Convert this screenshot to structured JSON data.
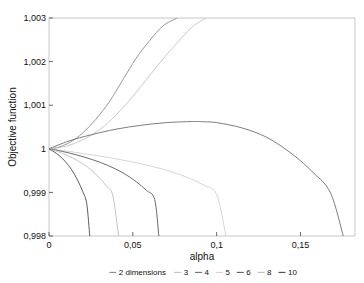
{
  "chart_data": {
    "type": "line",
    "title": "",
    "xlabel": "alpha",
    "ylabel": "Objective function",
    "xlim": [
      0,
      0.1825
    ],
    "ylim": [
      0.998,
      1.003
    ],
    "grid": false,
    "legend_position": "bottom",
    "x_tick_labels": [
      "0",
      "0,05",
      "0,1",
      "0,15"
    ],
    "x_tick_values": [
      0,
      0.05,
      0.1,
      0.15
    ],
    "y_tick_labels": [
      "1,003",
      "1,002",
      "1,001",
      "1",
      "0,999",
      "0,998"
    ],
    "y_tick_values": [
      1.003,
      1.002,
      1.001,
      1.0,
      0.999,
      0.998
    ],
    "legend_title": "dimensions",
    "series": [
      {
        "name": "2",
        "legend_label": "2 dimensions",
        "color": "#8c8c8c",
        "x": [
          0,
          0.006,
          0.013,
          0.02,
          0.028,
          0.036,
          0.044,
          0.052,
          0.06,
          0.068,
          0.0765
        ],
        "values": [
          1.0,
          1.00004,
          1.00016,
          1.00036,
          1.00068,
          1.00108,
          1.00158,
          1.00208,
          1.00248,
          1.00282,
          1.003
        ]
      },
      {
        "name": "3",
        "legend_label": "3",
        "color": "#c2c2c2",
        "x": [
          0,
          0.008,
          0.017,
          0.026,
          0.035,
          0.045,
          0.055,
          0.065,
          0.075,
          0.085,
          0.0935
        ],
        "values": [
          1.0,
          1.00004,
          1.00015,
          1.00033,
          1.00059,
          1.00098,
          1.00144,
          1.00192,
          1.00237,
          1.00278,
          1.003
        ]
      },
      {
        "name": "4",
        "legend_label": "4",
        "color": "#6e6e6e",
        "x": [
          0,
          0.012,
          0.025,
          0.04,
          0.055,
          0.07,
          0.085,
          0.092,
          0.1,
          0.115,
          0.13,
          0.145,
          0.158,
          0.168,
          0.1755
        ],
        "values": [
          1.0,
          1.00018,
          1.00032,
          1.00045,
          1.00054,
          1.0006,
          1.000625,
          1.00062,
          1.0006,
          1.00048,
          1.00026,
          0.99988,
          0.99944,
          0.99898,
          0.998
        ]
      },
      {
        "name": "5",
        "legend_label": "5",
        "color": "#d0d0d0",
        "x": [
          0,
          0.012,
          0.025,
          0.04,
          0.055,
          0.07,
          0.082,
          0.092,
          0.1,
          0.1055
        ],
        "values": [
          1.0,
          0.99994,
          0.999865,
          0.99977,
          0.999655,
          0.99951,
          0.99935,
          0.99917,
          0.99895,
          0.998
        ]
      },
      {
        "name": "6",
        "legend_label": "6",
        "color": "#5a5a5a",
        "x": [
          0,
          0.008,
          0.017,
          0.026,
          0.035,
          0.044,
          0.052,
          0.058,
          0.063,
          0.0655
        ],
        "values": [
          1.0,
          0.99994,
          0.999855,
          0.99975,
          0.99962,
          0.99945,
          0.999245,
          0.99905,
          0.99884,
          0.998
        ]
      },
      {
        "name": "8",
        "legend_label": "8",
        "color": "#bdbdbd",
        "x": [
          0,
          0.005,
          0.011,
          0.017,
          0.023,
          0.029,
          0.034,
          0.038,
          0.0415
        ],
        "values": [
          1.0,
          0.99994,
          0.999845,
          0.99973,
          0.99958,
          0.99938,
          0.999155,
          0.99893,
          0.998
        ]
      },
      {
        "name": "10",
        "legend_label": "10",
        "color": "#4a4a4a",
        "x": [
          0,
          0.003,
          0.0065,
          0.01,
          0.0135,
          0.017,
          0.0201,
          0.0225,
          0.0243
        ],
        "values": [
          1.0,
          0.99993,
          0.99983,
          0.999695,
          0.99952,
          0.999285,
          0.99902,
          0.998745,
          0.998
        ]
      }
    ]
  },
  "axes": {
    "x_title": "alpha",
    "y_title": "Objective function"
  },
  "legend": {
    "entries": [
      {
        "label": "2 dimensions",
        "color": "#8c8c8c"
      },
      {
        "label": "3",
        "color": "#c2c2c2"
      },
      {
        "label": "4",
        "color": "#6e6e6e"
      },
      {
        "label": "5",
        "color": "#d0d0d0"
      },
      {
        "label": "6",
        "color": "#5a5a5a"
      },
      {
        "label": "8",
        "color": "#bdbdbd"
      },
      {
        "label": "10",
        "color": "#4a4a4a"
      }
    ]
  },
  "colors": {
    "background": "#ffffff",
    "frame": "#b8b8b8",
    "text": "#111111"
  }
}
